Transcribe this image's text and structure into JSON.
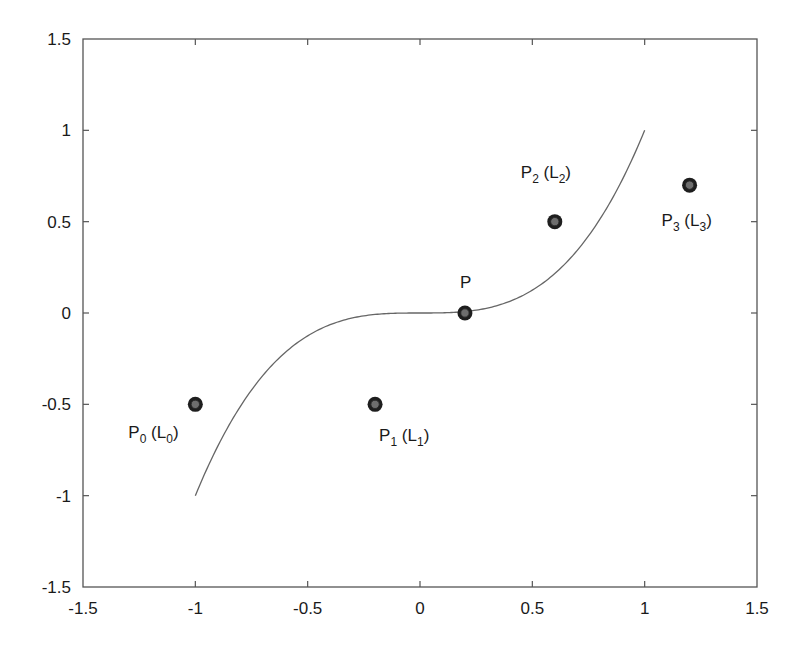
{
  "chart_data": {
    "type": "scatter",
    "title": "",
    "xlabel": "",
    "ylabel": "",
    "xlim": [
      -1.5,
      1.5
    ],
    "ylim": [
      -1.5,
      1.5
    ],
    "grid": false,
    "legend": null,
    "x_ticks": [
      "-1.5",
      "-1",
      "-0.5",
      "0",
      "0.5",
      "1",
      "1.5"
    ],
    "y_ticks": [
      "-1.5",
      "-1",
      "-0.5",
      "0",
      "0.5",
      "1",
      "1.5"
    ],
    "x_tick_values": [
      -1.5,
      -1,
      -0.5,
      0,
      0.5,
      1,
      1.5
    ],
    "y_tick_values": [
      -1.5,
      -1,
      -0.5,
      0,
      0.5,
      1,
      1.5
    ],
    "series": [
      {
        "name": "curve",
        "type": "line",
        "function": "y = x^3",
        "x_range": [
          -1,
          1
        ],
        "color": "#666666"
      },
      {
        "name": "points",
        "type": "scatter",
        "color": "#1e1e1e",
        "points": [
          {
            "label": "P",
            "sub": "0",
            "paren": "L",
            "paren_sub": "0",
            "x": -1.0,
            "y": -0.5,
            "label_pos": "below-left"
          },
          {
            "label": "P",
            "sub": "1",
            "paren": "L",
            "paren_sub": "1",
            "x": -0.2,
            "y": -0.5,
            "label_pos": "below-right"
          },
          {
            "label": "P",
            "sub": "",
            "paren": "",
            "paren_sub": "",
            "x": 0.2,
            "y": 0.0,
            "label_pos": "above"
          },
          {
            "label": "P",
            "sub": "2",
            "paren": "L",
            "paren_sub": "2",
            "x": 0.6,
            "y": 0.5,
            "label_pos": "above"
          },
          {
            "label": "P",
            "sub": "3",
            "paren": "L",
            "paren_sub": "3",
            "x": 1.2,
            "y": 0.7,
            "label_pos": "below"
          }
        ]
      }
    ],
    "annotations": [
      "P0 (L0)",
      "P1 (L1)",
      "P",
      "P2 (L2)",
      "P3 (L3)"
    ]
  },
  "layout": {
    "plot": {
      "left": 83,
      "right": 757,
      "top": 39,
      "bottom": 587
    },
    "tick_length": 6
  }
}
